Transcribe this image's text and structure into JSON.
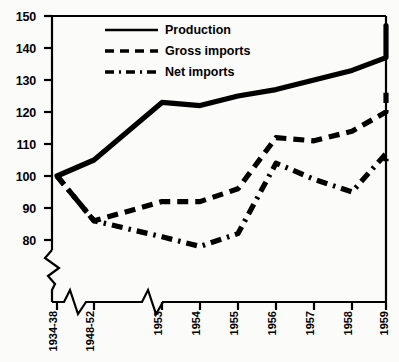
{
  "chart_data": {
    "type": "line",
    "title": "",
    "subtitle": "",
    "xlabel": "",
    "ylabel": "",
    "ylim": [
      76,
      150
    ],
    "yticks": [
      80,
      90,
      100,
      110,
      120,
      130,
      140,
      150
    ],
    "ytick_labels": [
      "80",
      "90",
      "100",
      "110",
      "120",
      "130",
      "140",
      "150"
    ],
    "grid": false,
    "axis_break_y": true,
    "axis_break_x": true,
    "legend_position": "top-center",
    "categories": [
      "1934-38",
      "1948-52",
      "1953",
      "1954",
      "1955",
      "1956",
      "1957",
      "1958",
      "1959",
      "1960"
    ],
    "series": [
      {
        "name": "Production",
        "style": "solid",
        "linewidth": "thick",
        "color": "#000000",
        "values": [
          100,
          105,
          123,
          122,
          125,
          127,
          130,
          133,
          137,
          147
        ]
      },
      {
        "name": "Gross imports",
        "style": "dashed",
        "linewidth": "thick",
        "color": "#000000",
        "values": [
          100,
          86,
          92,
          92,
          96,
          112,
          111,
          114,
          120,
          126
        ]
      },
      {
        "name": "Net imports",
        "style": "dash-dot",
        "linewidth": "thick",
        "color": "#000000",
        "values": [
          100,
          86,
          81,
          78,
          82,
          104,
          99,
          95,
          107,
          104
        ]
      }
    ]
  },
  "legend": {
    "items": [
      {
        "label": "Production",
        "style": "solid"
      },
      {
        "label": "Gross imports",
        "style": "dashed"
      },
      {
        "label": "Net imports",
        "style": "dash-dot"
      }
    ]
  }
}
